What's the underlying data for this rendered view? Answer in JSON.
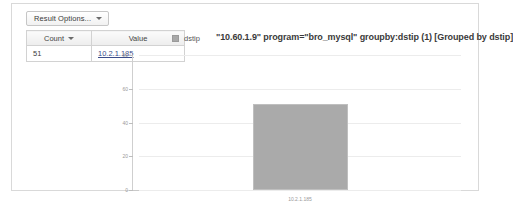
{
  "toolbar": {
    "result_options_label": "Result Options...",
    "caret_icon": "chevron-down-icon"
  },
  "results_table": {
    "columns": [
      {
        "key": "count",
        "label": "Count",
        "sortable": true
      },
      {
        "key": "value",
        "label": "Value",
        "sortable": false
      }
    ],
    "rows": [
      {
        "count": "51",
        "value": "10.2.1.185",
        "value_is_link": true
      }
    ]
  },
  "legend": {
    "position": "top-left",
    "entries": [
      {
        "label": "dstip",
        "color": "#a8a8a8"
      }
    ]
  },
  "chart_data": {
    "type": "bar",
    "title": "\"10.60.1.9\" program=\"bro_mysql\" groupby:dstip (1) [Grouped by dstip]",
    "categories": [
      "10.2.1.185"
    ],
    "series": [
      {
        "name": "dstip",
        "values": [
          51
        ],
        "color": "#aaaaaa"
      }
    ],
    "xlabel": "",
    "ylabel": "",
    "ylim": [
      0,
      80
    ],
    "yticks": [
      0,
      20,
      40,
      60,
      80
    ],
    "ytick_labels": [
      "0",
      "20",
      "40",
      "60",
      "80"
    ],
    "xtick_labels": [
      "10.2.1.185"
    ],
    "grid": true,
    "legend_position": "top-left"
  },
  "colors": {
    "bar": "#aaaaaa",
    "panel_border": "#d9d9d9",
    "grid": "#ececec",
    "axis": "#c9c9c9",
    "link": "#3b4c8a"
  }
}
